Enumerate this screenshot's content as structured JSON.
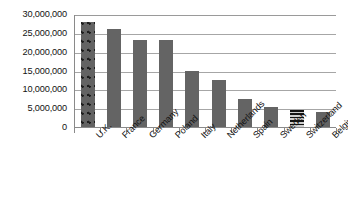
{
  "chart_data": {
    "type": "bar",
    "title": "",
    "subtitle": "",
    "xlabel": "",
    "ylabel": "",
    "grid": true,
    "legend": "none",
    "ylim": [
      0,
      30000000
    ],
    "categories": [
      "U.K.",
      "France",
      "Germany",
      "Poland",
      "Italy",
      "Netherlands",
      "Spain",
      "Sweden",
      "Switzerland",
      "Belgium"
    ],
    "values": [
      28000000,
      26000000,
      23000000,
      23000000,
      15000000,
      12500000,
      7500000,
      5200000,
      4500000,
      3900000
    ],
    "ytick_labels": [
      "30,000,000",
      "25,000,000",
      "20,000,000",
      "15,000,000",
      "10,000,000",
      "5,000,000",
      "0"
    ],
    "ytick_values": [
      30000000,
      25000000,
      20000000,
      15000000,
      10000000,
      5000000,
      0
    ],
    "bar_fill_color": "#646464",
    "bar_patterns": [
      "dots",
      "solid",
      "solid",
      "solid",
      "solid",
      "solid",
      "solid",
      "solid",
      "horizontal-stripes",
      "solid"
    ],
    "gridline_color": "#a6a6a6",
    "axis_color": "#8a8a8a",
    "background_color": "#ffffff",
    "text_color": "#131313"
  }
}
